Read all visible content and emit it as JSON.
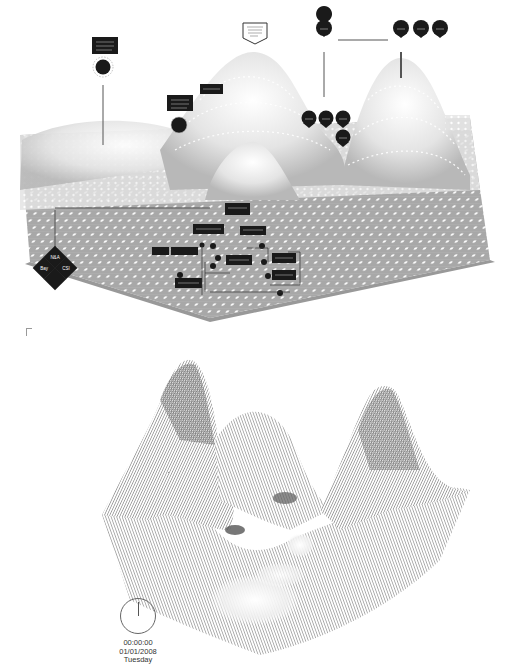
{
  "figure": {
    "top_panel": {
      "type": "3d terrain surface with dot grid and annotation markers",
      "peaks": [
        "left-rear-low",
        "center-rear-high",
        "center-middle",
        "right-rear-high"
      ],
      "markers": {
        "flag_label": {
          "shape": "pentagon-flag"
        },
        "pin_markers_top_row": [
          "pin-1",
          "pin-2",
          "pin-3",
          "pin-4"
        ],
        "pin_markers_mid_cluster": [
          "pin-5",
          "pin-6",
          "pin-7",
          "pin-8"
        ],
        "label_boxes": [
          "label-box-1",
          "label-box-2",
          "label-box-3"
        ],
        "circle_badges": [
          "badge-1",
          "badge-2"
        ],
        "diamond_legend": {
          "shape": "diamond",
          "quadrants": [
            "N&A",
            "Bay",
            "CSI",
            ""
          ]
        },
        "flow_diagram": {
          "nodes": 10,
          "arrows": 8
        }
      },
      "colors": {
        "surface": "#d8d8d8",
        "grid": "#9a9a9a",
        "dots": "#ffffff",
        "marker": "#1a1a1a"
      }
    },
    "bottom_panel": {
      "type": "3d wireframe mesh surface",
      "peaks": [
        "left-high",
        "center-mid",
        "right-high"
      ],
      "colors": {
        "mesh": "#555555",
        "highlight": "#f2f2f2"
      }
    },
    "clock": {
      "time": "00:00:00",
      "date": "01/01/2008",
      "weekday": "Tuesday"
    }
  }
}
